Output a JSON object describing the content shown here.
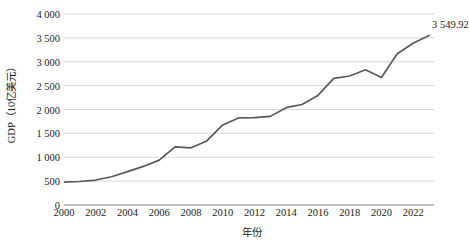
{
  "chart_data": {
    "type": "line",
    "title": "",
    "xlabel": "年份",
    "ylabel": "GDP（10亿美元）",
    "xlim": [
      2000,
      2023
    ],
    "ylim": [
      0,
      4000
    ],
    "grid": true,
    "legend": "none",
    "line_color": "#595959",
    "gridline_color": "#d9d9d9",
    "axis_color": "#808080",
    "x": [
      2000,
      2001,
      2002,
      2003,
      2004,
      2005,
      2006,
      2007,
      2008,
      2009,
      2010,
      2011,
      2012,
      2013,
      2014,
      2015,
      2016,
      2017,
      2018,
      2019,
      2020,
      2021,
      2022,
      2023
    ],
    "y_tick_labels": [
      "0",
      "500",
      "1 000",
      "1 500",
      "2 000",
      "2 500",
      "3 000",
      "3 500",
      "4 000"
    ],
    "y_tick_values": [
      0,
      500,
      1000,
      1500,
      2000,
      2500,
      3000,
      3500,
      4000
    ],
    "x_tick_labels": [
      "2000",
      "2002",
      "2004",
      "2006",
      "2008",
      "2010",
      "2012",
      "2014",
      "2016",
      "2018",
      "2020",
      "2022"
    ],
    "x_tick_values": [
      2000,
      2002,
      2004,
      2006,
      2008,
      2010,
      2012,
      2014,
      2016,
      2018,
      2020,
      2022
    ],
    "series": [
      {
        "name": "GDP",
        "values": [
          478,
          492,
          523,
          592,
          700,
          808,
          940,
          1216,
          1198,
          1342,
          1676,
          1823,
          1828,
          1856,
          2039,
          2104,
          2295,
          2652,
          2702,
          2831,
          2671,
          3167,
          3386,
          3550
        ]
      }
    ],
    "annotations": [
      {
        "name": "endpoint-value-label",
        "text": "3 549.92",
        "x": 2023,
        "y": 3550
      }
    ]
  }
}
